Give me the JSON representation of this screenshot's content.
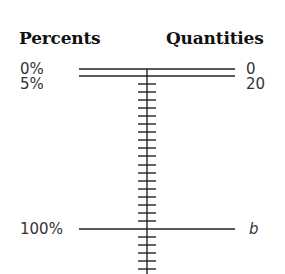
{
  "headers": {
    "left": "Percents",
    "right": "Quantities"
  },
  "rows": [
    {
      "percent": "0%",
      "quantity": "0",
      "y": 69
    },
    {
      "percent": "5%",
      "quantity": "20",
      "y": 76
    },
    {
      "percent": "100%",
      "quantity": "b",
      "y": 229
    }
  ],
  "axis": {
    "x": 147,
    "top": 69,
    "bottom": 274,
    "tick_spacing": 8,
    "tick_half_width": 9,
    "line_color": "#222222"
  }
}
